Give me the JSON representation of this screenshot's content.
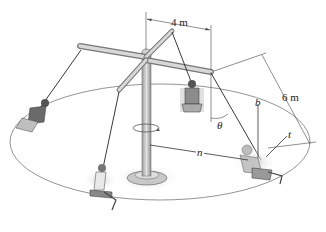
{
  "figure": {
    "labels": {
      "arm_length": "4 m",
      "rope_length": "6 m",
      "angle": "θ",
      "binormal": "b",
      "tangent": "t",
      "normal": "n"
    },
    "colors": {
      "line": "#333333",
      "post": "#b8b8b8",
      "post_dark": "#8a8a8a",
      "shadow": "#d8d8d8",
      "path": "#555555"
    }
  }
}
